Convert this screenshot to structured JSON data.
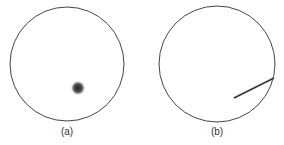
{
  "panels": [
    {
      "caption": "(a)",
      "circle": {
        "cx": 67,
        "cy": 64,
        "r": 57
      },
      "blob": {
        "cx": 78,
        "cy": 88,
        "r": 7
      }
    },
    {
      "caption": "(b)",
      "circle": {
        "cx": 217,
        "cy": 64,
        "r": 58
      },
      "line": {
        "x1": 234,
        "y1": 98,
        "x2": 274,
        "y2": 78
      }
    }
  ],
  "colors": {
    "stroke": "#444444",
    "blob": "#333333"
  }
}
